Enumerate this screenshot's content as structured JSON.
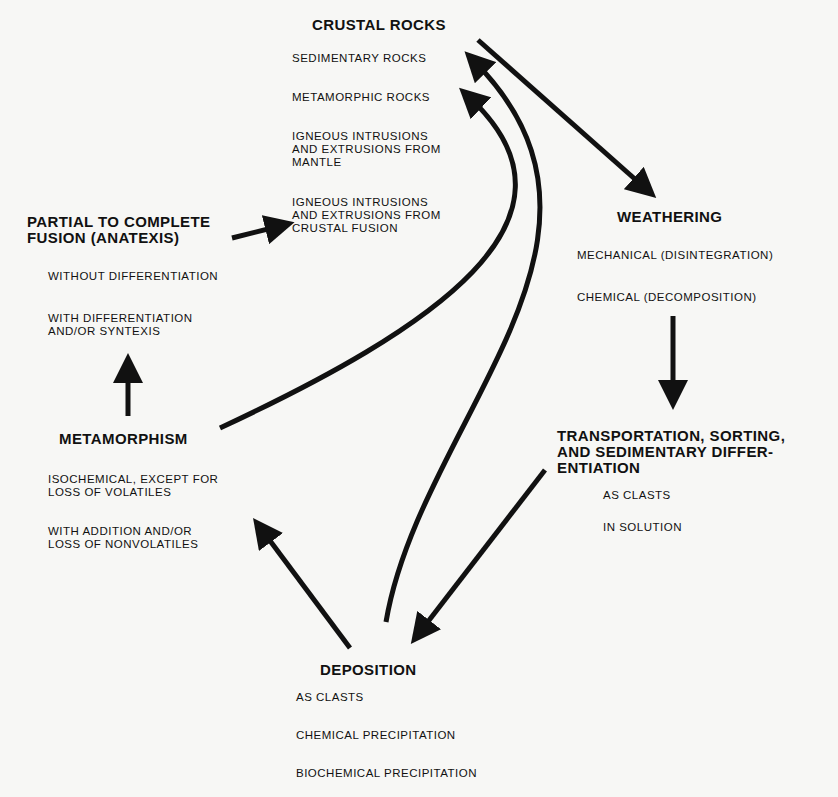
{
  "diagram": {
    "type": "rock-cycle-flow",
    "nodes": {
      "crustal_rocks": {
        "title": "CRUSTAL ROCKS",
        "items": [
          "SEDIMENTARY ROCKS",
          "METAMORPHIC ROCKS",
          "IGNEOUS INTRUSIONS\nAND EXTRUSIONS FROM\nMANTLE",
          "IGNEOUS INTRUSIONS\nAND EXTRUSIONS FROM\nCRUSTAL FUSION"
        ]
      },
      "weathering": {
        "title": "WEATHERING",
        "items": [
          "MECHANICAL (DISINTEGRATION)",
          "CHEMICAL (DECOMPOSITION)"
        ]
      },
      "transportation": {
        "title": "TRANSPORTATION, SORTING,\nAND SEDIMENTARY DIFFER-\nENTIATION",
        "items": [
          "AS CLASTS",
          "IN SOLUTION"
        ]
      },
      "deposition": {
        "title": "DEPOSITION",
        "items": [
          "AS CLASTS",
          "CHEMICAL PRECIPITATION",
          "BIOCHEMICAL PRECIPITATION"
        ]
      },
      "metamorphism": {
        "title": "METAMORPHISM",
        "items": [
          "ISOCHEMICAL, EXCEPT FOR\nLOSS OF VOLATILES",
          "WITH ADDITION AND/OR\nLOSS OF NONVOLATILES"
        ]
      },
      "fusion": {
        "title": "PARTIAL TO COMPLETE\nFUSION (ANATEXIS)",
        "items": [
          "WITHOUT DIFFERENTIATION",
          "WITH DIFFERENTIATION\nAND/OR SYNTEXIS"
        ]
      }
    },
    "edges": [
      {
        "from": "CRUSTAL ROCKS",
        "to": "WEATHERING"
      },
      {
        "from": "WEATHERING",
        "to": "TRANSPORTATION"
      },
      {
        "from": "TRANSPORTATION",
        "to": "DEPOSITION"
      },
      {
        "from": "DEPOSITION",
        "to": "METAMORPHISM"
      },
      {
        "from": "DEPOSITION",
        "to": "SEDIMENTARY ROCKS"
      },
      {
        "from": "METAMORPHISM",
        "to": "METAMORPHIC ROCKS"
      },
      {
        "from": "METAMORPHISM",
        "to": "PARTIAL TO COMPLETE FUSION"
      },
      {
        "from": "PARTIAL TO COMPLETE FUSION",
        "to": "IGNEOUS INTRUSIONS FROM CRUSTAL FUSION"
      }
    ],
    "colors": {
      "ink": "#111111",
      "paper": "#f7f7f5"
    }
  }
}
